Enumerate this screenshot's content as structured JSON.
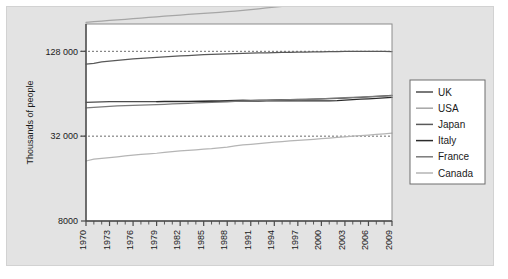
{
  "figure": {
    "background": "#ffffff",
    "panel_background": "#e3e3e3",
    "plot_background": "#ffffff"
  },
  "chart_data": {
    "type": "line",
    "title": "",
    "xlabel": "",
    "ylabel": "Thousands of people",
    "yscale": "log",
    "ylim": [
      8000,
      200000
    ],
    "xlim": [
      1970,
      2009
    ],
    "grid": "horizontal-dashed",
    "legend_position": "right-outside",
    "ytick_labels": [
      "128 000",
      "32 000",
      "8000"
    ],
    "ytick_values": [
      128000,
      32000,
      8000
    ],
    "xtick_labels": [
      "1970",
      "1973",
      "1976",
      "1979",
      "1982",
      "1985",
      "1988",
      "1991",
      "1994",
      "1997",
      "2000",
      "2003",
      "2006",
      "2009"
    ],
    "xtick_values": [
      1970,
      1973,
      1976,
      1979,
      1982,
      1985,
      1988,
      1991,
      1994,
      1997,
      2000,
      2003,
      2006,
      2009
    ],
    "x": [
      1970,
      1971,
      1972,
      1973,
      1974,
      1975,
      1976,
      1977,
      1978,
      1979,
      1980,
      1981,
      1982,
      1983,
      1984,
      1985,
      1986,
      1987,
      1988,
      1989,
      1990,
      1991,
      1992,
      1993,
      1994,
      1995,
      1996,
      1997,
      1998,
      1999,
      2000,
      2001,
      2002,
      2003,
      2004,
      2005,
      2006,
      2007,
      2008,
      2009
    ],
    "series": [
      {
        "name": "UK",
        "color": "#4d4d4d",
        "values": [
          55632,
          55907,
          56079,
          56210,
          56224,
          56215,
          56206,
          56179,
          56167,
          56228,
          56314,
          56352,
          56306,
          56347,
          56460,
          56685,
          56852,
          57009,
          57158,
          57358,
          57561,
          57439,
          57585,
          57714,
          57862,
          58025,
          58164,
          58314,
          58475,
          58684,
          58886,
          59113,
          59366,
          59637,
          59988,
          60413,
          60827,
          61319,
          61824,
          62261
        ]
      },
      {
        "name": "USA",
        "color": "#a6a6a6",
        "values": [
          205052,
          207661,
          209896,
          211909,
          213854,
          215973,
          218035,
          220239,
          222585,
          225055,
          227225,
          229466,
          231664,
          233792,
          235825,
          237924,
          240133,
          242289,
          244499,
          246819,
          249623,
          252981,
          256514,
          259919,
          263126,
          266278,
          269394,
          272647,
          275854,
          279040,
          282172,
          284969,
          287625,
          290108,
          292805,
          295517,
          298380,
          301231,
          304094,
          306772
        ]
      },
      {
        "name": "Japan",
        "color": "#595959",
        "values": [
          103720,
          105145,
          107595,
          109104,
          110573,
          111940,
          113094,
          114165,
          115190,
          116155,
          117060,
          117902,
          118728,
          119483,
          120235,
          121049,
          121660,
          122239,
          122745,
          123205,
          123611,
          124101,
          124567,
          124938,
          125265,
          125570,
          125864,
          126166,
          126486,
          126686,
          126926,
          127316,
          127486,
          127694,
          127787,
          127768,
          127770,
          127771,
          127692,
          127510
        ]
      },
      {
        "name": "Italy",
        "color": "#2b2b2b",
        "values": [
          null,
          null,
          null,
          null,
          null,
          null,
          null,
          null,
          null,
          56318,
          56389,
          56502,
          56544,
          56564,
          56577,
          56593,
          56596,
          56602,
          56629,
          56672,
          56719,
          56759,
          56797,
          56832,
          56844,
          56844,
          56860,
          56890,
          56907,
          56916,
          56924,
          56977,
          57157,
          57605,
          58175,
          58607,
          58942,
          59375,
          59832,
          60192
        ]
      },
      {
        "name": "France",
        "color": "#7a7a7a",
        "values": [
          50772,
          51251,
          51701,
          52118,
          52460,
          52699,
          52909,
          53145,
          53376,
          53606,
          53880,
          54182,
          54492,
          54772,
          55026,
          55284,
          55547,
          55824,
          56118,
          56423,
          56709,
          56976,
          57240,
          57467,
          57659,
          57844,
          58026,
          58207,
          58398,
          58623,
          58896,
          59267,
          59636,
          59954,
          60262,
          60596,
          60940,
          61290,
          61642,
          61978
        ]
      },
      {
        "name": "Canada",
        "color": "#b5b5b5",
        "values": [
          21324,
          21962,
          22218,
          22492,
          22808,
          23143,
          23450,
          23726,
          23963,
          24202,
          24516,
          24820,
          25117,
          25367,
          25608,
          25843,
          26101,
          26449,
          26798,
          27282,
          27698,
          28031,
          28377,
          28682,
          28999,
          29302,
          29611,
          29907,
          30157,
          30404,
          30689,
          31021,
          31373,
          31676,
          31995,
          32312,
          32571,
          32888,
          33246,
          33628
        ]
      }
    ]
  },
  "legend": {
    "items": [
      {
        "label": "UK",
        "color": "#4d4d4d"
      },
      {
        "label": "USA",
        "color": "#a6a6a6"
      },
      {
        "label": "Japan",
        "color": "#595959"
      },
      {
        "label": "Italy",
        "color": "#2b2b2b"
      },
      {
        "label": "France",
        "color": "#7a7a7a"
      },
      {
        "label": "Canada",
        "color": "#b5b5b5"
      }
    ]
  }
}
